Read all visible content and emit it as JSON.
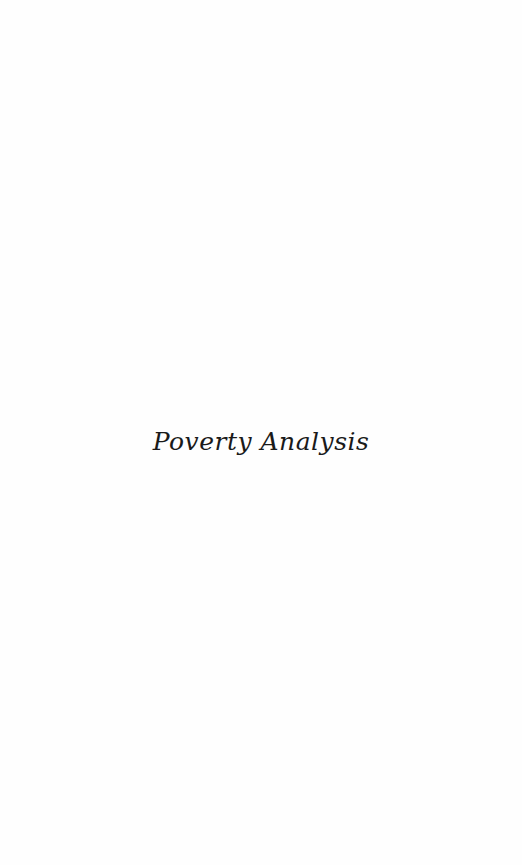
{
  "page": {
    "title": "Poverty Analysis"
  }
}
